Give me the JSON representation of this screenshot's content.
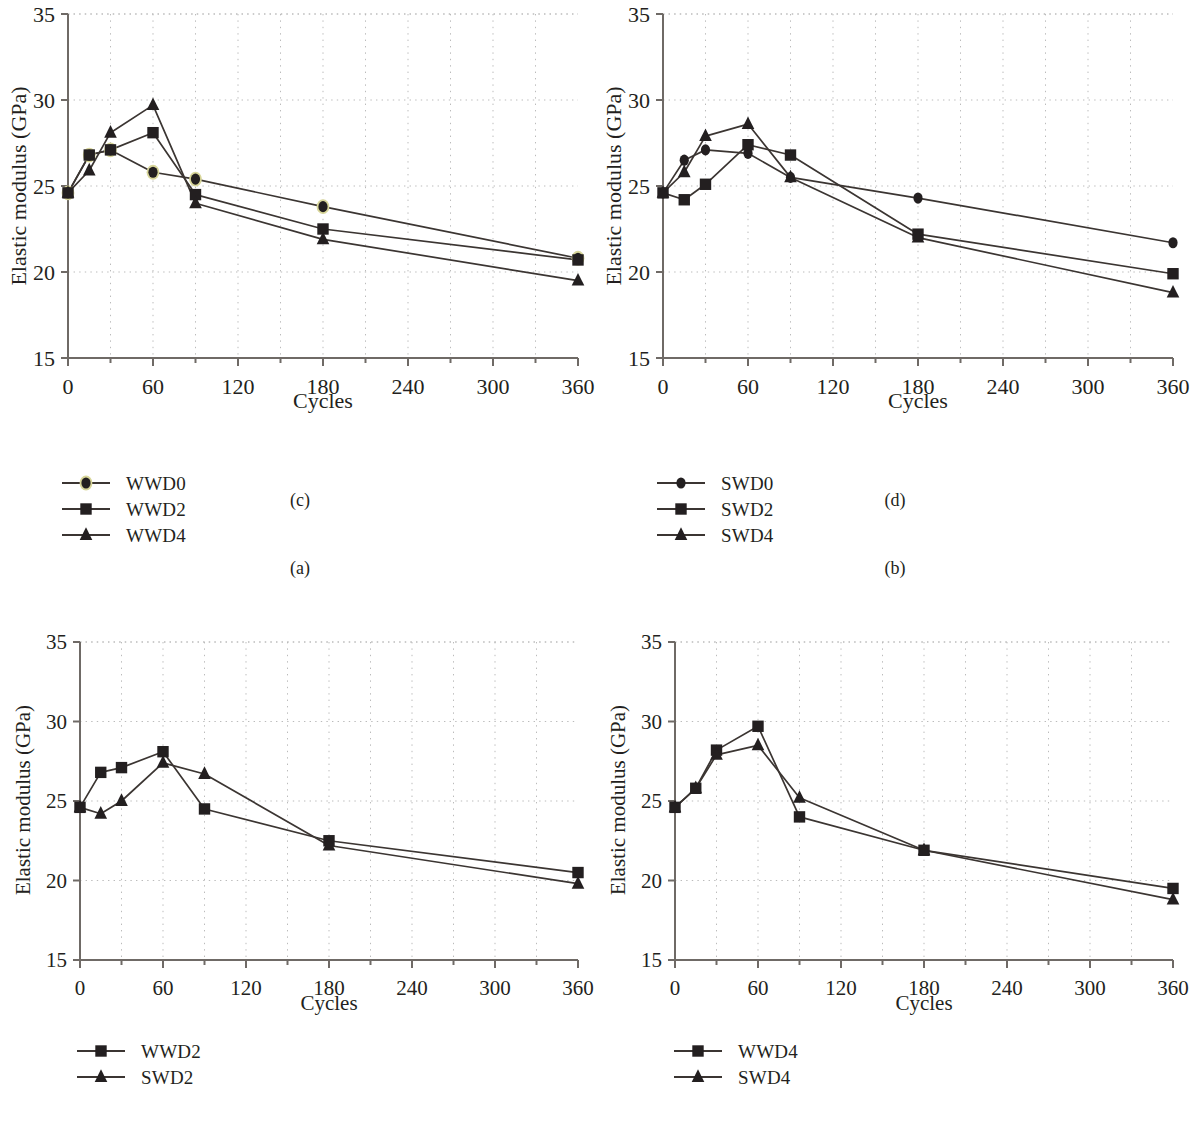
{
  "figure": {
    "panels": [
      "a",
      "b",
      "c",
      "d"
    ],
    "caption_a": "(a)",
    "caption_b": "(b)",
    "caption_c": "(c)",
    "caption_d": "(d)",
    "axis": {
      "xlabel": "Cycles",
      "ylabel": "Elastic modulus (GPa)",
      "xticks": [
        "0",
        "60",
        "120",
        "180",
        "240",
        "300",
        "360"
      ],
      "yticks": [
        "15",
        "20",
        "25",
        "30",
        "35"
      ]
    },
    "colors": {
      "line": "#3b3532",
      "marker": "#231f20",
      "marker_highlight": "#d8d69a",
      "grid": "#bbbbbb",
      "axis": "#6f6a66",
      "text": "#231f20"
    }
  },
  "chart_data": [
    {
      "id": "a",
      "type": "line",
      "title": "(a)",
      "xlabel": "Cycles",
      "ylabel": "Elastic modulus (GPa)",
      "xlim": [
        0,
        360
      ],
      "ylim": [
        15,
        35
      ],
      "xticks": [
        0,
        60,
        120,
        180,
        240,
        300,
        360
      ],
      "yticks": [
        15,
        20,
        25,
        30,
        35
      ],
      "grid": true,
      "legend_position": "below-left",
      "x": [
        0,
        15,
        30,
        60,
        90,
        180,
        360
      ],
      "series": [
        {
          "name": "WWD0",
          "marker": "circle",
          "values": [
            24.6,
            26.8,
            27.1,
            25.8,
            25.4,
            23.8,
            20.8
          ]
        },
        {
          "name": "WWD2",
          "marker": "square",
          "values": [
            24.6,
            26.8,
            27.1,
            28.1,
            24.5,
            22.5,
            20.7
          ]
        },
        {
          "name": "WWD4",
          "marker": "triangle",
          "values": [
            24.6,
            25.9,
            28.1,
            29.7,
            24.0,
            21.9,
            19.5
          ]
        }
      ]
    },
    {
      "id": "b",
      "type": "line",
      "title": "(b)",
      "xlabel": "Cycles",
      "ylabel": "Elastic modulus (GPa)",
      "xlim": [
        0,
        360
      ],
      "ylim": [
        15,
        35
      ],
      "xticks": [
        0,
        60,
        120,
        180,
        240,
        300,
        360
      ],
      "yticks": [
        15,
        20,
        25,
        30,
        35
      ],
      "grid": true,
      "legend_position": "below-left",
      "x": [
        0,
        15,
        30,
        60,
        90,
        180,
        360
      ],
      "series": [
        {
          "name": "SWD0",
          "marker": "circle",
          "values": [
            24.6,
            26.5,
            27.1,
            26.9,
            25.5,
            24.3,
            21.7
          ]
        },
        {
          "name": "SWD2",
          "marker": "square",
          "values": [
            24.6,
            24.2,
            25.1,
            27.4,
            26.8,
            22.2,
            19.9
          ]
        },
        {
          "name": "SWD4",
          "marker": "triangle",
          "values": [
            24.6,
            25.8,
            27.9,
            28.6,
            25.5,
            22.0,
            18.8
          ]
        }
      ]
    },
    {
      "id": "c",
      "type": "line",
      "title": "(c)",
      "xlabel": "Cycles",
      "ylabel": "Elastic modulus (GPa)",
      "xlim": [
        0,
        360
      ],
      "ylim": [
        15,
        35
      ],
      "xticks": [
        0,
        60,
        120,
        180,
        240,
        300,
        360
      ],
      "yticks": [
        15,
        20,
        25,
        30,
        35
      ],
      "grid": true,
      "legend_position": "below-left",
      "x": [
        0,
        15,
        30,
        60,
        90,
        180,
        360
      ],
      "series": [
        {
          "name": "WWD2",
          "marker": "square",
          "values": [
            24.6,
            26.8,
            27.1,
            28.1,
            24.5,
            22.5,
            20.5
          ]
        },
        {
          "name": "SWD2",
          "marker": "triangle",
          "values": [
            24.6,
            24.2,
            25.0,
            27.4,
            26.7,
            22.2,
            19.8
          ]
        }
      ]
    },
    {
      "id": "d",
      "type": "line",
      "title": "(d)",
      "xlabel": "Cycles",
      "ylabel": "Elastic modulus (GPa)",
      "xlim": [
        0,
        360
      ],
      "ylim": [
        15,
        35
      ],
      "xticks": [
        0,
        60,
        120,
        180,
        240,
        300,
        360
      ],
      "yticks": [
        15,
        20,
        25,
        30,
        35
      ],
      "grid": true,
      "legend_position": "below-left",
      "x": [
        0,
        15,
        30,
        60,
        90,
        180,
        360
      ],
      "series": [
        {
          "name": "WWD4",
          "marker": "square",
          "values": [
            24.6,
            25.8,
            28.2,
            29.7,
            24.0,
            21.9,
            19.5
          ]
        },
        {
          "name": "SWD4",
          "marker": "triangle",
          "values": [
            24.6,
            25.8,
            27.9,
            28.5,
            25.2,
            21.9,
            18.8
          ]
        }
      ]
    }
  ],
  "legends": {
    "a": [
      {
        "label": "WWD0",
        "marker": "circle",
        "highlight": true
      },
      {
        "label": "WWD2",
        "marker": "square",
        "highlight": false
      },
      {
        "label": "WWD4",
        "marker": "triangle",
        "highlight": false
      }
    ],
    "b": [
      {
        "label": "SWD0",
        "marker": "circle",
        "highlight": false
      },
      {
        "label": "SWD2",
        "marker": "square",
        "highlight": false
      },
      {
        "label": "SWD4",
        "marker": "triangle",
        "highlight": false
      }
    ],
    "c": [
      {
        "label": "WWD2",
        "marker": "square",
        "highlight": false
      },
      {
        "label": "SWD2",
        "marker": "triangle",
        "highlight": false
      }
    ],
    "d": [
      {
        "label": "WWD4",
        "marker": "square",
        "highlight": false
      },
      {
        "label": "SWD4",
        "marker": "triangle",
        "highlight": false
      }
    ]
  }
}
